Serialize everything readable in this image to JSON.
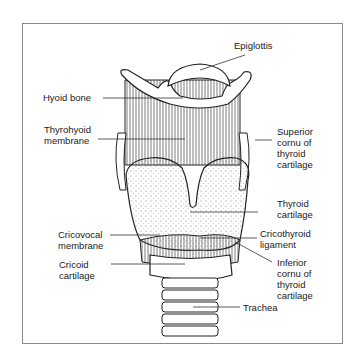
{
  "labels": {
    "epiglottis": "Epiglottis",
    "hyoid_bone": "Hyoid bone",
    "thyrohyoid_membrane": "Thyrohyoid\nmembrane",
    "superior_cornu": "Superior\ncornu of\nthyroid\ncartilage",
    "thyroid_cartilage": "Thyroid\ncartilage",
    "cricovocal_membrane": "Cricovocal\nmembrane",
    "cricothyroid_ligament": "Cricothyroid\nligament",
    "cricoid_cartilage": "Cricoid\ncartilage",
    "inferior_cornu": "Inferior\ncornu of\nthyroid\ncartilage",
    "trachea": "Trachea"
  }
}
